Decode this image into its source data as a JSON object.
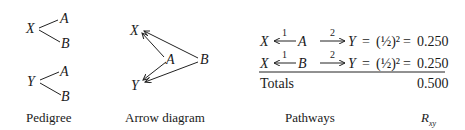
{
  "pedigree": {
    "caption": "Pedigree",
    "top": {
      "parent": "X",
      "children": [
        "A",
        "B"
      ]
    },
    "bottom": {
      "parent": "Y",
      "children": [
        "A",
        "B"
      ]
    }
  },
  "arrow_diagram": {
    "caption": "Arrow diagram",
    "nodes": [
      "X",
      "Y",
      "A",
      "B"
    ],
    "edges": [
      {
        "from": "A",
        "to": "X"
      },
      {
        "from": "A",
        "to": "Y"
      },
      {
        "from": "B",
        "to": "X"
      },
      {
        "from": "B",
        "to": "Y"
      }
    ]
  },
  "pathways": {
    "caption": "Pathways",
    "value_caption": "R",
    "value_caption_sub": "xy",
    "rows": [
      {
        "start": "X",
        "label1": "1",
        "mid": "A",
        "label2": "2",
        "end": "Y",
        "eq": "=",
        "expr": "(½)²",
        "eq2": "=",
        "value": "0.250"
      },
      {
        "start": "X",
        "label1": "1",
        "mid": "B",
        "label2": "2",
        "end": "Y",
        "eq": "=",
        "expr": "(½)²",
        "eq2": "=",
        "value": "0.250"
      }
    ],
    "totals_label": "Totals",
    "totals_value": "0.500"
  }
}
